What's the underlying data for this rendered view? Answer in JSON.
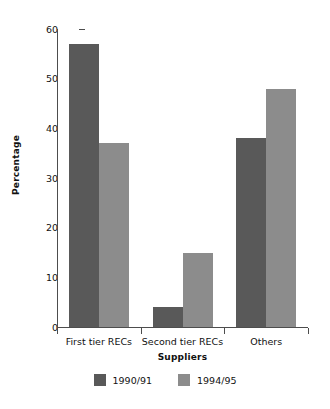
{
  "chart_data": {
    "type": "bar",
    "title": "",
    "subtitle": "",
    "xlabel": "Suppliers",
    "ylabel": "Percentage",
    "categories": [
      "First tier RECs",
      "Second tier RECs",
      "Others"
    ],
    "series": [
      {
        "name": "1990/91",
        "color": "#595959",
        "values": [
          57,
          4,
          38
        ]
      },
      {
        "name": "1994/95",
        "color": "#8c8c8c",
        "values": [
          37,
          15,
          48
        ]
      }
    ],
    "ylim": [
      0,
      60
    ],
    "ytick_labels": [
      "60",
      "50",
      "40",
      "30",
      "20",
      "10",
      "0"
    ],
    "ytick_values": [
      60,
      50,
      40,
      30,
      20,
      10,
      0
    ],
    "grid": false,
    "legend_position": "bottom",
    "axis_color": "#4d4d4d",
    "background_color": "#ffffff",
    "text_color": "#111111"
  }
}
